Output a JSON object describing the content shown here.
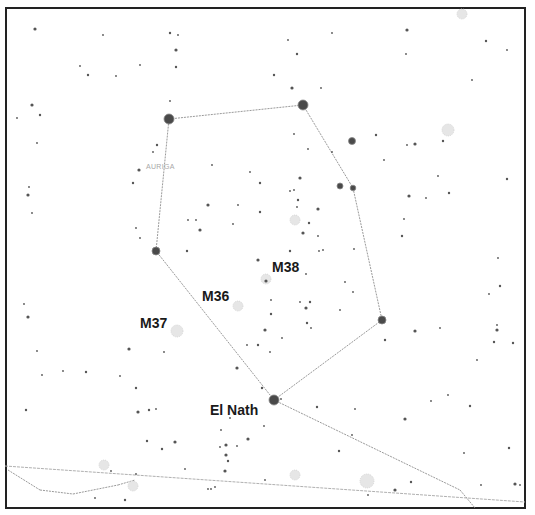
{
  "map": {
    "constellation_label": "AURIGA",
    "labels": [
      {
        "id": "m38",
        "text": "M38",
        "x": 272,
        "y": 272
      },
      {
        "id": "m36",
        "text": "M36",
        "x": 202,
        "y": 301
      },
      {
        "id": "m37",
        "text": "M37",
        "x": 140,
        "y": 328
      },
      {
        "id": "el-nath",
        "text": "El Nath",
        "x": 210,
        "y": 415
      }
    ],
    "constellation_label_pos": {
      "x": 146,
      "y": 169
    },
    "bright_stars": [
      {
        "name": "capella",
        "x": 169,
        "y": 119,
        "r": 5
      },
      {
        "name": "menkalinan",
        "x": 303,
        "y": 105,
        "r": 5
      },
      {
        "name": "theta-aurigae",
        "x": 382,
        "y": 320,
        "r": 4
      },
      {
        "name": "el-nath-star",
        "x": 274,
        "y": 400,
        "r": 5
      },
      {
        "name": "iota-aurigae",
        "x": 156,
        "y": 251,
        "r": 4
      },
      {
        "name": "delta-aurigae-area",
        "x": 352,
        "y": 141,
        "r": 3.5
      },
      {
        "name": "star-340-186",
        "x": 340,
        "y": 186,
        "r": 3
      },
      {
        "name": "star-353-188",
        "x": 353,
        "y": 188,
        "r": 2.8
      }
    ],
    "clusters": [
      {
        "name": "m38-cluster",
        "x": 266,
        "y": 279,
        "r": 5
      },
      {
        "name": "m36-cluster",
        "x": 238,
        "y": 306,
        "r": 5
      },
      {
        "name": "m37-cluster",
        "x": 177,
        "y": 331,
        "r": 6
      },
      {
        "name": "cluster-295-220",
        "x": 295,
        "y": 220,
        "r": 5
      },
      {
        "name": "cluster-448-130",
        "x": 448,
        "y": 130,
        "r": 6
      },
      {
        "name": "cluster-462-14",
        "x": 462,
        "y": 14,
        "r": 5
      },
      {
        "name": "cluster-104-465",
        "x": 104,
        "y": 465,
        "r": 5
      },
      {
        "name": "cluster-133-486",
        "x": 133,
        "y": 486,
        "r": 5
      },
      {
        "name": "cluster-367-481",
        "x": 367,
        "y": 481,
        "r": 7
      },
      {
        "name": "cluster-295-475",
        "x": 295,
        "y": 475,
        "r": 5
      }
    ],
    "constellation_lines": [
      [
        169,
        119,
        303,
        105
      ],
      [
        303,
        105,
        353,
        188
      ],
      [
        353,
        188,
        382,
        320
      ],
      [
        382,
        320,
        274,
        400
      ],
      [
        274,
        400,
        156,
        251
      ],
      [
        156,
        251,
        169,
        119
      ],
      [
        274,
        400,
        460,
        490
      ],
      [
        460,
        490,
        475,
        508
      ],
      [
        40,
        490,
        73,
        494
      ],
      [
        73,
        494,
        118,
        485
      ],
      [
        118,
        485,
        135,
        480
      ],
      [
        8,
        470,
        40,
        490
      ]
    ],
    "ecliptic_line": [
      5,
      466,
      525,
      502
    ],
    "small_stars": [
      [
        35,
        29
      ],
      [
        103,
        35
      ],
      [
        140,
        65
      ],
      [
        170,
        33
      ],
      [
        178,
        35
      ],
      [
        176,
        50
      ],
      [
        176,
        67
      ],
      [
        116,
        76
      ],
      [
        80,
        66
      ],
      [
        88,
        75
      ],
      [
        32,
        105
      ],
      [
        17,
        118
      ],
      [
        40,
        115
      ],
      [
        37,
        143
      ],
      [
        29,
        187
      ],
      [
        28,
        195
      ],
      [
        32,
        213
      ],
      [
        170,
        101
      ],
      [
        157,
        145
      ],
      [
        153,
        152
      ],
      [
        139,
        170
      ],
      [
        133,
        183
      ],
      [
        212,
        165
      ],
      [
        250,
        172
      ],
      [
        260,
        183
      ],
      [
        208,
        205
      ],
      [
        238,
        205
      ],
      [
        260,
        212
      ],
      [
        188,
        220
      ],
      [
        196,
        220
      ],
      [
        200,
        230
      ],
      [
        136,
        228
      ],
      [
        140,
        238
      ],
      [
        187,
        251
      ],
      [
        233,
        224
      ],
      [
        258,
        260
      ],
      [
        274,
        75
      ],
      [
        288,
        40
      ],
      [
        332,
        33
      ],
      [
        297,
        54
      ],
      [
        407,
        30
      ],
      [
        406,
        54
      ],
      [
        486,
        41
      ],
      [
        507,
        50
      ],
      [
        472,
        80
      ],
      [
        292,
        88
      ],
      [
        321,
        88
      ],
      [
        294,
        134
      ],
      [
        376,
        135
      ],
      [
        407,
        145
      ],
      [
        415,
        144
      ],
      [
        443,
        141
      ],
      [
        438,
        176
      ],
      [
        384,
        160
      ],
      [
        449,
        193
      ],
      [
        409,
        196
      ],
      [
        426,
        198
      ],
      [
        507,
        179
      ],
      [
        308,
        149
      ],
      [
        332,
        152
      ],
      [
        300,
        178
      ],
      [
        294,
        190
      ],
      [
        290,
        191
      ],
      [
        298,
        200
      ],
      [
        297,
        207
      ],
      [
        318,
        209
      ],
      [
        309,
        223
      ],
      [
        318,
        236
      ],
      [
        319,
        251
      ],
      [
        290,
        251
      ],
      [
        303,
        233
      ],
      [
        354,
        249
      ],
      [
        402,
        236
      ],
      [
        404,
        219
      ],
      [
        323,
        250
      ],
      [
        266,
        281
      ],
      [
        306,
        274
      ],
      [
        345,
        282
      ],
      [
        310,
        302
      ],
      [
        300,
        302
      ],
      [
        306,
        308
      ],
      [
        307,
        323
      ],
      [
        311,
        328
      ],
      [
        271,
        300
      ],
      [
        271,
        314
      ],
      [
        265,
        330
      ],
      [
        282,
        338
      ],
      [
        258,
        345
      ],
      [
        270,
        352
      ],
      [
        247,
        345
      ],
      [
        237,
        368
      ],
      [
        353,
        292
      ],
      [
        340,
        310
      ],
      [
        385,
        340
      ],
      [
        440,
        328
      ],
      [
        415,
        331
      ],
      [
        494,
        342
      ],
      [
        497,
        325
      ],
      [
        489,
        294
      ],
      [
        500,
        286
      ],
      [
        497,
        330
      ],
      [
        477,
        360
      ],
      [
        470,
        406
      ],
      [
        448,
        395
      ],
      [
        431,
        401
      ],
      [
        405,
        419
      ],
      [
        355,
        409
      ],
      [
        352,
        435
      ],
      [
        339,
        451
      ],
      [
        368,
        495
      ],
      [
        395,
        490
      ],
      [
        411,
        482
      ],
      [
        464,
        453
      ],
      [
        481,
        485
      ],
      [
        509,
        448
      ],
      [
        515,
        484
      ],
      [
        520,
        485
      ],
      [
        513,
        343
      ],
      [
        498,
        258
      ],
      [
        24,
        304
      ],
      [
        28,
        317
      ],
      [
        37,
        351
      ],
      [
        63,
        371
      ],
      [
        86,
        372
      ],
      [
        120,
        376
      ],
      [
        138,
        412
      ],
      [
        149,
        410
      ],
      [
        111,
        471
      ],
      [
        136,
        474
      ],
      [
        147,
        441
      ],
      [
        175,
        442
      ],
      [
        185,
        469
      ],
      [
        136,
        388
      ],
      [
        156,
        409
      ],
      [
        221,
        430
      ],
      [
        226,
        445
      ],
      [
        220,
        447
      ],
      [
        237,
        446
      ],
      [
        228,
        461
      ],
      [
        211,
        489
      ],
      [
        225,
        471
      ],
      [
        262,
        388
      ],
      [
        281,
        399
      ],
      [
        264,
        426
      ],
      [
        317,
        407
      ],
      [
        226,
        455
      ],
      [
        95,
        498
      ],
      [
        125,
        500
      ],
      [
        215,
        487
      ],
      [
        230,
        418
      ],
      [
        248,
        439
      ],
      [
        265,
        480
      ],
      [
        208,
        489
      ],
      [
        162,
        449
      ],
      [
        164,
        352
      ],
      [
        129,
        349
      ],
      [
        26,
        410
      ],
      [
        42,
        375
      ]
    ]
  }
}
